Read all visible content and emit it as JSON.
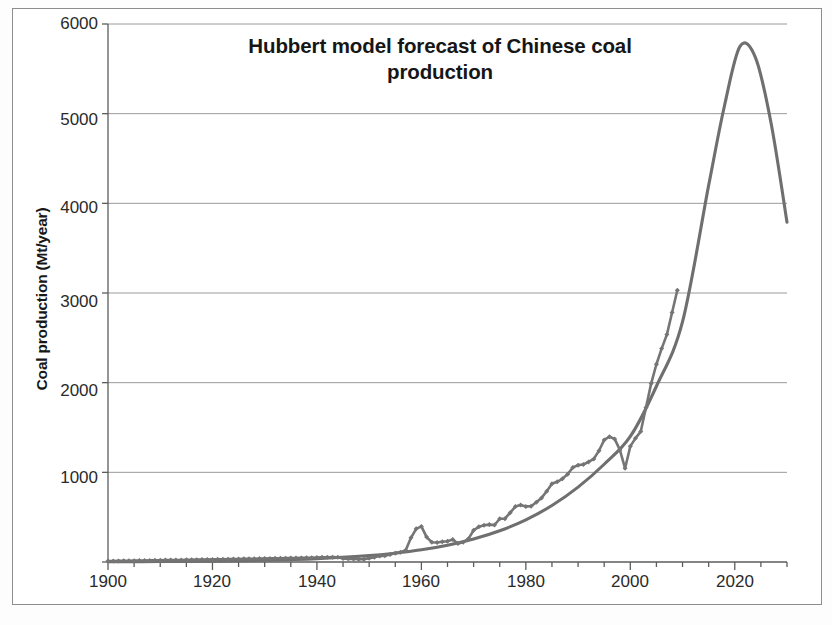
{
  "chart_data": {
    "type": "line",
    "title": "Hubbert model forecast of Chinese coal production",
    "xlabel": "",
    "ylabel": "Coal production (Mt/year)",
    "xlim": [
      1900,
      2030
    ],
    "ylim": [
      0,
      6000
    ],
    "grid": true,
    "legend": "none",
    "xticks": [
      1900,
      1920,
      1940,
      1960,
      1980,
      2000,
      2020
    ],
    "xtick_labels": [
      "1900",
      "1920",
      "1940",
      "1960",
      "1980",
      "2000",
      "2020"
    ],
    "x_minor_tick_interval": 5,
    "yticks": [
      0,
      1000,
      2000,
      3000,
      4000,
      5000,
      6000
    ],
    "ytick_labels": [
      "",
      "1000",
      "2000",
      "3000",
      "4000",
      "5000",
      "6000"
    ],
    "series": [
      {
        "name": "Historical Chinese coal production",
        "style": "line-with-diamond-markers",
        "color": "#757575",
        "x": [
          1900,
          1901,
          1902,
          1903,
          1904,
          1905,
          1906,
          1907,
          1908,
          1909,
          1910,
          1911,
          1912,
          1913,
          1914,
          1915,
          1916,
          1917,
          1918,
          1919,
          1920,
          1921,
          1922,
          1923,
          1924,
          1925,
          1926,
          1927,
          1928,
          1929,
          1930,
          1931,
          1932,
          1933,
          1934,
          1935,
          1936,
          1937,
          1938,
          1939,
          1940,
          1941,
          1942,
          1943,
          1944,
          1945,
          1946,
          1947,
          1948,
          1949,
          1950,
          1951,
          1952,
          1953,
          1954,
          1955,
          1956,
          1957,
          1958,
          1959,
          1960,
          1961,
          1962,
          1963,
          1964,
          1965,
          1966,
          1967,
          1968,
          1969,
          1970,
          1971,
          1972,
          1973,
          1974,
          1975,
          1976,
          1977,
          1978,
          1979,
          1980,
          1981,
          1982,
          1983,
          1984,
          1985,
          1986,
          1987,
          1988,
          1989,
          1990,
          1991,
          1992,
          1993,
          1994,
          1995,
          1996,
          1997,
          1998,
          1999,
          2000,
          2001,
          2002,
          2003,
          2004,
          2005,
          2006,
          2007,
          2008,
          2009
        ],
        "values": [
          10,
          11,
          12,
          13,
          14,
          15,
          16,
          17,
          18,
          19,
          20,
          21,
          22,
          23,
          23,
          24,
          25,
          26,
          27,
          28,
          29,
          30,
          31,
          32,
          33,
          34,
          35,
          36,
          37,
          38,
          39,
          40,
          41,
          42,
          43,
          44,
          45,
          46,
          47,
          48,
          50,
          52,
          53,
          54,
          52,
          40,
          35,
          33,
          32,
          32,
          43,
          53,
          66,
          70,
          84,
          98,
          110,
          131,
          270,
          370,
          397,
          278,
          220,
          217,
          225,
          232,
          252,
          206,
          220,
          258,
          354,
          392,
          410,
          417,
          413,
          482,
          483,
          550,
          618,
          635,
          620,
          622,
          666,
          715,
          789,
          872,
          894,
          928,
          980,
          1054,
          1080,
          1087,
          1116,
          1150,
          1240,
          1361,
          1397,
          1373,
          1250,
          1045,
          1290,
          1381,
          1455,
          1722,
          1992,
          2205,
          2380,
          2536,
          2782,
          3030
        ]
      },
      {
        "name": "Hubbert model forecast",
        "style": "smooth-line",
        "color": "#6f6f6f",
        "x": [
          1900,
          1910,
          1920,
          1930,
          1940,
          1950,
          1955,
          1960,
          1965,
          1970,
          1975,
          1980,
          1985,
          1990,
          1995,
          2000,
          2005,
          2010,
          2015,
          2018,
          2021,
          2024,
          2027,
          2030
        ],
        "values": [
          2,
          5,
          10,
          20,
          38,
          72,
          99,
          136,
          187,
          256,
          348,
          470,
          630,
          835,
          1090,
          1400,
          1960,
          2680,
          4200,
          5080,
          5750,
          5620,
          4880,
          3790
        ],
        "peak_year": 2021,
        "peak_value": 5750
      }
    ]
  },
  "axes": {
    "y_tick_labels": [
      {
        "value": "6000",
        "top": 14
      },
      {
        "value": "5000",
        "top": 110
      },
      {
        "value": "4000",
        "top": 198
      },
      {
        "value": "3000",
        "top": 292
      },
      {
        "value": "2000",
        "top": 381
      },
      {
        "value": "1000",
        "top": 468
      }
    ],
    "x_tick_labels": [
      {
        "value": "1900",
        "left": 73
      },
      {
        "value": "1920",
        "left": 177
      },
      {
        "value": "1940",
        "left": 282
      },
      {
        "value": "1960",
        "left": 386
      },
      {
        "value": "1980",
        "left": 491
      },
      {
        "value": "2000",
        "left": 595
      },
      {
        "value": "2020",
        "left": 700
      }
    ]
  },
  "colors": {
    "gridline": "#9a9a9a",
    "axis": "#5c5c5c",
    "data_series": "#757575",
    "model_curve": "#6f6f6f",
    "frame": "#8d8d8d",
    "text": "#1c1c1c"
  }
}
